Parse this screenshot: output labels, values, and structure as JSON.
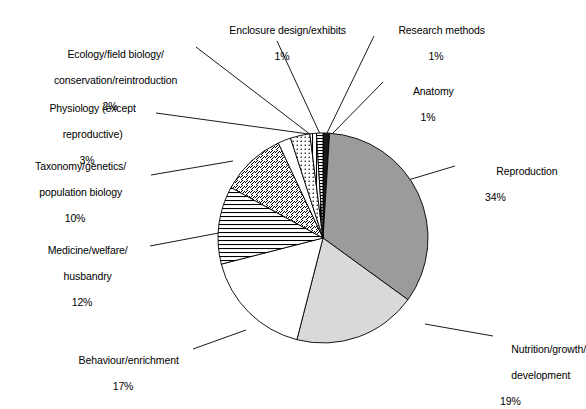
{
  "chart_data": {
    "type": "pie",
    "title": "",
    "subtitle": "",
    "xlabel": "",
    "ylabel": "",
    "legend_position": "none",
    "grid": false,
    "units": "percent",
    "total": 100,
    "categories": [
      "Anatomy",
      "Reproduction",
      "Nutrition/growth/development",
      "Behaviour/enrichment",
      "Medicine/welfare/husbandry",
      "Taxonomy/genetics/population biology",
      "Ecology/field biology/conservation/reintroduction",
      "Physiology (except reproductive)",
      "Enclosure design/exhibits",
      "Research methods"
    ],
    "values": [
      1,
      34,
      19,
      17,
      12,
      10,
      2,
      3,
      1,
      1
    ],
    "slices": [
      {
        "id": "anatomy",
        "label_lines": [
          "Anatomy"
        ],
        "percent_text": "1%",
        "value": 1,
        "fill": "#1a1a1a",
        "pattern": "solid-black",
        "start_angle": 0,
        "end_angle": 3.6
      },
      {
        "id": "reproduction",
        "label_lines": [
          "Reproduction"
        ],
        "percent_text": "34%",
        "value": 34,
        "fill": "#9b9b9b",
        "pattern": "solid-gray",
        "start_angle": 3.6,
        "end_angle": 126
      },
      {
        "id": "nutrition-growth-development",
        "label_lines": [
          "Nutrition/growth/",
          "development"
        ],
        "percent_text": "19%",
        "value": 19,
        "fill": "#d9d9d9",
        "pattern": "solid-light-gray",
        "start_angle": 126,
        "end_angle": 194.4
      },
      {
        "id": "behaviour-enrichment",
        "label_lines": [
          "Behaviour/enrichment"
        ],
        "percent_text": "17%",
        "value": 17,
        "fill": "#ffffff",
        "pattern": "none",
        "start_angle": 194.4,
        "end_angle": 255.6
      },
      {
        "id": "medicine-welfare-husbandry",
        "label_lines": [
          "Medicine/welfare/",
          "husbandry"
        ],
        "percent_text": "12%",
        "value": 12,
        "fill": "#ffffff",
        "pattern": "horizontal-lines",
        "start_angle": 255.6,
        "end_angle": 298.8
      },
      {
        "id": "taxonomy-genetics-population-biology",
        "label_lines": [
          "Taxonomy/genetics/",
          "population biology"
        ],
        "percent_text": "10%",
        "value": 10,
        "fill": "#ffffff",
        "pattern": "diagonal-lines",
        "start_angle": 298.8,
        "end_angle": 334.8
      },
      {
        "id": "ecology-field-biology",
        "label_lines": [
          "Ecology/field biology/",
          "conservation/reintroduction"
        ],
        "percent_text": "2%",
        "value": 2,
        "fill": "#ffffff",
        "pattern": "none",
        "start_angle": 334.8,
        "end_angle": 342
      },
      {
        "id": "physiology-except-reproductive",
        "label_lines": [
          "Physiology (except",
          "reproductive)"
        ],
        "percent_text": "3%",
        "value": 3,
        "fill": "#ffffff",
        "pattern": "dots",
        "start_angle": 342,
        "end_angle": 352.8
      },
      {
        "id": "enclosure-design-exhibits",
        "label_lines": [
          "Enclosure design/exhibits"
        ],
        "percent_text": "1%",
        "value": 1,
        "fill": "#ffffff",
        "pattern": "vertical-lines",
        "start_angle": 352.8,
        "end_angle": 356.4
      },
      {
        "id": "research-methods",
        "label_lines": [
          "Research methods"
        ],
        "percent_text": "1%",
        "value": 1,
        "fill": "#ffffff",
        "pattern": "horizontal-lines-dense",
        "start_angle": 356.4,
        "end_angle": 360
      }
    ],
    "geometry": {
      "center_x": 323,
      "center_y": 238,
      "radius": 105,
      "start_from": "12-oclock",
      "direction": "clockwise"
    },
    "colors": {
      "outline": "#000000",
      "leader_line": "#000000",
      "background": "#ffffff",
      "dark_slice": "#1a1a1a",
      "mid_gray_slice": "#9b9b9b",
      "light_gray_slice": "#d9d9d9"
    }
  }
}
